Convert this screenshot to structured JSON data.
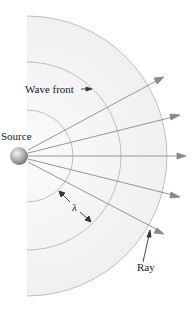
{
  "figure": {
    "type": "wave-propagation-diagram",
    "labels": {
      "source": "Source",
      "wave_front": "Wave front",
      "wavelength": "λ",
      "ray": "Ray"
    },
    "wave_front_count": 3,
    "ray_count": 5,
    "colors": {
      "background": "#ffffff",
      "wave_region_fill": "#f4f4f4",
      "wave_front_stroke": "#b8b8b8",
      "ray_stroke": "#8a8a8a",
      "arrowhead": "#8a8a8a",
      "annotation_stroke": "#333333",
      "source_sphere_light": "#eeeeee",
      "source_sphere_dark": "#6e6e6e",
      "text": "#222222"
    }
  }
}
